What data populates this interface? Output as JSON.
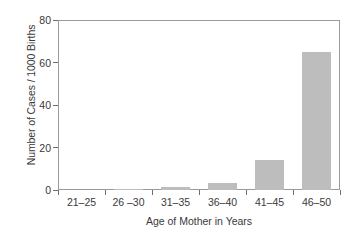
{
  "chart_data": {
    "type": "bar",
    "title": "",
    "xlabel": "Age of Mother in Years",
    "ylabel": "Number of Cases / 1000 Births",
    "categories": [
      "21–25",
      "26 –30",
      "31–35",
      "36–40",
      "41–45",
      "46–50"
    ],
    "values": [
      0,
      0.2,
      1.5,
      3.5,
      14,
      65
    ],
    "ylim": [
      0,
      80
    ],
    "yticks": [
      0,
      20,
      40,
      60,
      80
    ],
    "ytick_labels": [
      "0",
      "20",
      "40",
      "60",
      "80"
    ],
    "grid": false,
    "legend": null,
    "bar_color": "#bdbdbd",
    "axis_color": "#9a9a9a",
    "text_color": "#3a3a3a",
    "background": "#ffffff"
  }
}
